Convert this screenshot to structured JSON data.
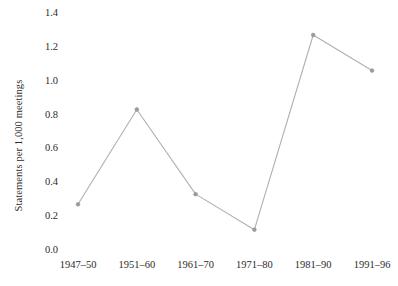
{
  "chart_data": {
    "type": "line",
    "title": "",
    "subtitle": "",
    "xlabel": "",
    "ylabel": "Statements per 1,000 meetings",
    "categories": [
      "1947–50",
      "1951–60",
      "1961–70",
      "1971–80",
      "1981–90",
      "1991–96"
    ],
    "values": [
      0.27,
      0.83,
      0.33,
      0.12,
      1.27,
      1.06
    ],
    "ylim": [
      0.0,
      1.4
    ],
    "ytick_labels": [
      "0.0",
      "0.2",
      "0.4",
      "0.6",
      "0.8",
      "1.0",
      "1.2",
      "1.4"
    ],
    "ytick_values": [
      0.0,
      0.2,
      0.4,
      0.6,
      0.8,
      1.0,
      1.2,
      1.4
    ],
    "grid": false,
    "legend": false,
    "legend_position": "none",
    "series": [
      {
        "name": "Statements per 1,000 meetings",
        "values": [
          0.27,
          0.83,
          0.33,
          0.12,
          1.27,
          1.06
        ],
        "line_color": "#b0b0b0",
        "marker_color": "#9a9a9a",
        "marker": "circle"
      }
    ]
  },
  "colors": {
    "background": "#ffffff",
    "line": "#b0b0b0",
    "marker": "#9a9a9a",
    "text": "#2b2b2b",
    "grid": "#ededed"
  }
}
